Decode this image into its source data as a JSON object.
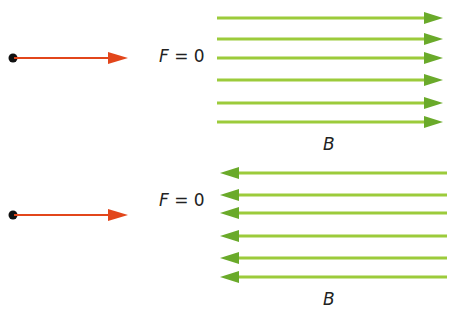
{
  "diagram": {
    "panels": [
      {
        "force_label_var": "F",
        "force_label_rest": " = 0",
        "field_label": "B",
        "field_direction": "right",
        "particle_velocity_direction": "right",
        "field_line_count": 6
      },
      {
        "force_label_var": "F",
        "force_label_rest": " = 0",
        "field_label": "B",
        "field_direction": "left",
        "particle_velocity_direction": "right",
        "field_line_count": 6
      }
    ],
    "colors": {
      "velocity_arrow": "#e2461b",
      "particle": "#111111",
      "field_line": "#8cc63f",
      "field_arrowhead": "#6aaa2a"
    }
  }
}
